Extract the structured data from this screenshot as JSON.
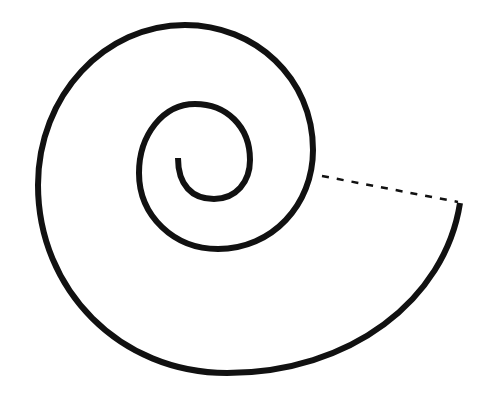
{
  "figure": {
    "stroke_color": "#111111",
    "background_color": "#ffffff",
    "spiral": {
      "start": [
        178,
        158
      ],
      "end": [
        460,
        203
      ],
      "turns": 2.25,
      "stroke_width": 6
    },
    "dashed_segment": {
      "from": [
        322,
        176
      ],
      "to": [
        460,
        203
      ],
      "style": "dashed"
    }
  }
}
